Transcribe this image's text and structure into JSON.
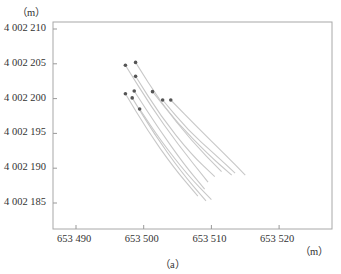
{
  "chart_data": {
    "type": "line",
    "title": "",
    "caption": "（a）",
    "xlabel": "（m）",
    "ylabel": "（m）",
    "xlim": [
      653486.6,
      653527.9
    ],
    "ylim": [
      4002181,
      4002211
    ],
    "grid": false,
    "legend": null,
    "x_ticks": [
      "653 490",
      "653 500",
      "653 510",
      "653 520"
    ],
    "y_ticks": [
      "4 002 210",
      "4 002 205",
      "4 002 200",
      "4 002 195",
      "4 002 190",
      "4 002 185"
    ],
    "series": [
      {
        "name": "track 1",
        "start": [
          653497.3,
          4002204.8
        ],
        "points": [
          [
            653497.3,
            4002204.8
          ],
          [
            653501.0,
            4002199.0
          ],
          [
            653505.0,
            4002193.5
          ],
          [
            653509.5,
            4002188.0
          ]
        ]
      },
      {
        "name": "track 2",
        "start": [
          653498.8,
          4002205.2
        ],
        "points": [
          [
            653498.8,
            4002205.2
          ],
          [
            653502.5,
            4002199.5
          ],
          [
            653507.0,
            4002194.0
          ],
          [
            653511.5,
            4002189.5
          ]
        ]
      },
      {
        "name": "track 3",
        "start": [
          653498.8,
          4002203.2
        ],
        "points": [
          [
            653498.8,
            4002203.2
          ],
          [
            653502.5,
            4002197.5
          ],
          [
            653507.0,
            4002192.0
          ],
          [
            653510.5,
            4002188.8
          ]
        ]
      },
      {
        "name": "track 4",
        "start": [
          653497.3,
          4002200.7
        ],
        "points": [
          [
            653497.3,
            4002200.7
          ],
          [
            653500.5,
            4002195.5
          ],
          [
            653504.5,
            4002190.0
          ],
          [
            653508.0,
            4002186.0
          ]
        ]
      },
      {
        "name": "track 5",
        "start": [
          653498.6,
          4002201.1
        ],
        "points": [
          [
            653498.6,
            4002201.1
          ],
          [
            653502.0,
            4002196.0
          ],
          [
            653506.0,
            4002190.5
          ],
          [
            653509.0,
            4002187.0
          ]
        ]
      },
      {
        "name": "track 6",
        "start": [
          653498.3,
          4002200.1
        ],
        "points": [
          [
            653498.3,
            4002200.1
          ],
          [
            653501.5,
            4002195.0
          ],
          [
            653505.5,
            4002189.5
          ],
          [
            653509.2,
            4002185.3
          ]
        ]
      },
      {
        "name": "track 7",
        "start": [
          653499.4,
          4002198.5
        ],
        "points": [
          [
            653499.4,
            4002198.5
          ],
          [
            653502.5,
            4002194.0
          ],
          [
            653506.5,
            4002189.0
          ],
          [
            653510.0,
            4002185.5
          ]
        ]
      },
      {
        "name": "track 8",
        "start": [
          653501.3,
          4002201.0
        ],
        "points": [
          [
            653501.3,
            4002201.0
          ],
          [
            653505.0,
            4002196.5
          ],
          [
            653509.5,
            4002192.0
          ],
          [
            653513.0,
            4002189.0
          ]
        ]
      },
      {
        "name": "track 9",
        "start": [
          653502.8,
          4002199.8
        ],
        "points": [
          [
            653502.8,
            4002199.8
          ],
          [
            653506.5,
            4002195.5
          ],
          [
            653510.5,
            4002192.0
          ],
          [
            653513.5,
            4002189.3
          ]
        ]
      },
      {
        "name": "track 10",
        "start": [
          653504.0,
          4002199.8
        ],
        "points": [
          [
            653504.0,
            4002199.8
          ],
          [
            653508.0,
            4002195.8
          ],
          [
            653512.0,
            4002192.0
          ],
          [
            653515.0,
            4002189.0
          ]
        ]
      }
    ]
  },
  "colors": {
    "axis": "#9a9a9a",
    "track": "#c8c8c8",
    "marker": "#555555",
    "text": "#333333"
  }
}
